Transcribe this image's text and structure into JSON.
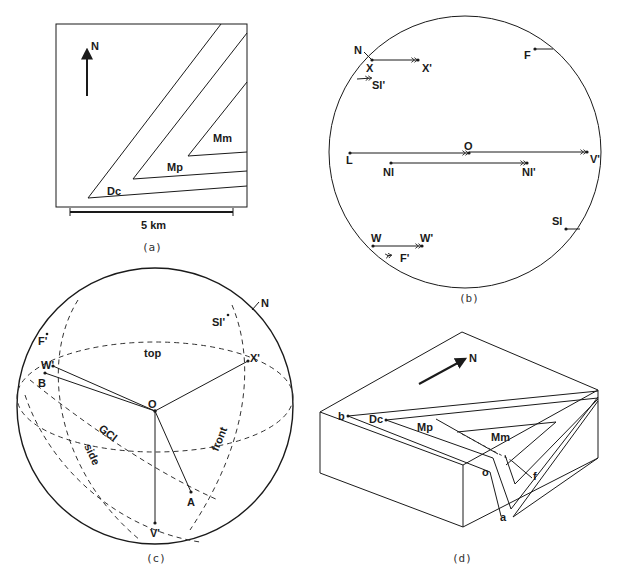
{
  "panels": {
    "a": {
      "caption": "(a)",
      "north_label": "N",
      "units": [
        "Dc",
        "Mp",
        "Mm"
      ],
      "scale_bar_label": "5 km"
    },
    "b": {
      "caption": "(b)",
      "labels": {
        "N": "N",
        "X": "X",
        "X_prime": "X'",
        "Sl_prime": "Sl'",
        "F": "F",
        "O": "O",
        "L": "L",
        "V_prime": "V'",
        "Nl": "Nl",
        "Nl_prime": "Nl'",
        "W": "W",
        "W_prime": "W'",
        "F_prime": "F'",
        "Sl": "Sl"
      }
    },
    "c": {
      "caption": "(c)",
      "labels": {
        "N": "N",
        "Sl_prime": "Sl'",
        "F_prime": "F'",
        "top": "top",
        "X_prime": "X'",
        "W_prime": "W'",
        "B": "B",
        "O": "O",
        "GCl": "GCl",
        "side": "side",
        "front": "front",
        "A": "A",
        "V_prime": "V'"
      }
    },
    "d": {
      "caption": "(d)",
      "north_label": "N",
      "units": [
        "Dc",
        "Mp",
        "Mm"
      ],
      "points": {
        "b": "b",
        "o": "o",
        "f": "f",
        "a": "a"
      }
    }
  },
  "colors": {
    "ink": "#1a1a1a",
    "background": "#ffffff"
  }
}
